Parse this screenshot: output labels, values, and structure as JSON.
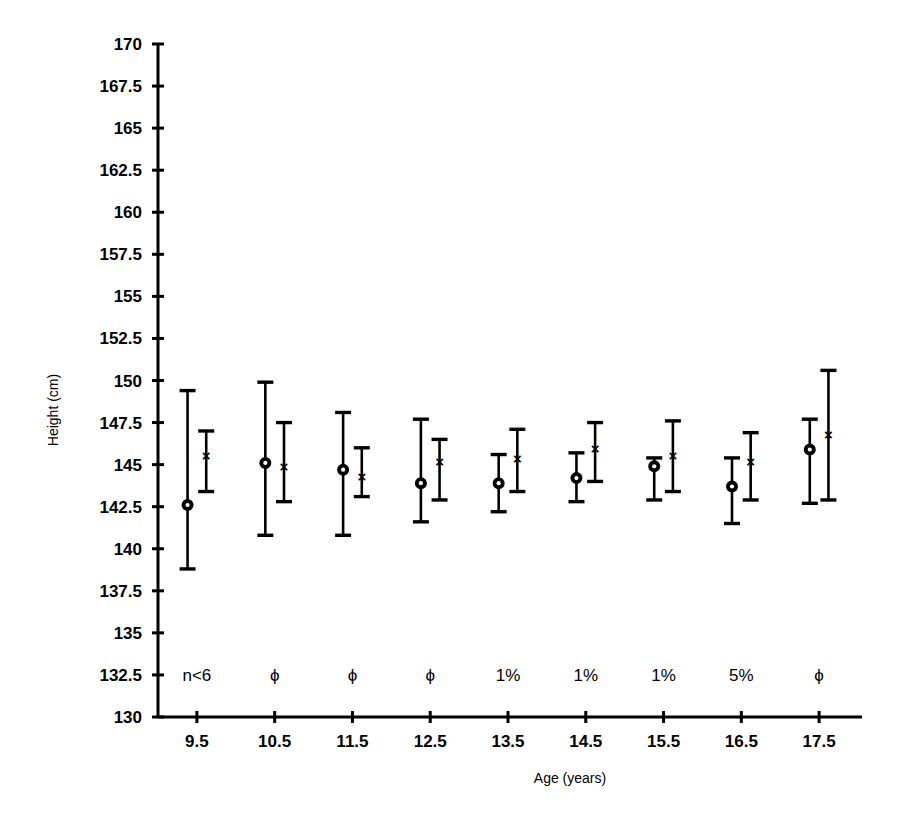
{
  "chart_data": {
    "type": "scatter",
    "title": "",
    "xlabel": "Age (years)",
    "ylabel": "Height (cm)",
    "xlim": [
      9.0,
      18.0
    ],
    "ylim": [
      130,
      170
    ],
    "grid": false,
    "legend": null,
    "ytick_labels": [
      "170",
      "167.5",
      "165",
      "162.5",
      "160",
      "157.5",
      "155",
      "152.5",
      "150",
      "147.5",
      "145",
      "142.5",
      "140",
      "137.5",
      "135",
      "132.5",
      "130"
    ],
    "ytick_values": [
      170,
      167.5,
      165,
      162.5,
      160,
      157.5,
      155,
      152.5,
      150,
      147.5,
      145,
      142.5,
      140,
      137.5,
      135,
      132.5,
      130
    ],
    "categories": [
      "9.5",
      "10.5",
      "11.5",
      "12.5",
      "13.5",
      "14.5",
      "15.5",
      "16.5",
      "17.5"
    ],
    "x": [
      9.5,
      10.5,
      11.5,
      12.5,
      13.5,
      14.5,
      15.5,
      16.5,
      17.5
    ],
    "annotations": [
      "n<6",
      "ϕ",
      "ϕ",
      "ϕ",
      "1%",
      "1%",
      "1%",
      "5%",
      "ϕ"
    ],
    "annotation_y": 132.5,
    "series": [
      {
        "name": "circle-series",
        "marker": "circle",
        "offset": -0.12,
        "values": [
          142.6,
          145.1,
          144.7,
          143.9,
          143.9,
          144.2,
          144.9,
          143.7,
          145.9
        ],
        "lower": [
          138.8,
          140.8,
          140.8,
          141.6,
          142.2,
          142.8,
          142.9,
          141.5,
          142.7
        ],
        "upper": [
          149.4,
          149.9,
          148.1,
          147.7,
          145.6,
          145.7,
          145.4,
          145.4,
          147.7
        ]
      },
      {
        "name": "x-series",
        "marker": "x",
        "offset": 0.12,
        "values": [
          145.6,
          144.9,
          144.3,
          145.2,
          145.4,
          146.0,
          145.6,
          145.2,
          146.8
        ],
        "lower": [
          143.4,
          142.8,
          143.1,
          142.9,
          143.4,
          144.0,
          143.4,
          142.9,
          142.9
        ],
        "upper": [
          147.0,
          147.5,
          146.0,
          146.5,
          147.1,
          147.5,
          147.6,
          146.9,
          150.6
        ]
      }
    ]
  }
}
